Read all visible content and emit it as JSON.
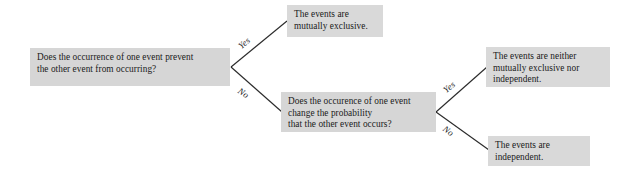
{
  "diagram": {
    "type": "decision-tree",
    "stroke_color": "#2b2b2b",
    "box_fill_color": "#d6d6d6",
    "background_color": "#ffffff",
    "nodes": [
      {
        "id": "root-question",
        "kind": "decision",
        "text": "Does the occurrence of one event prevent\nthe other event from occurring?"
      },
      {
        "id": "mutually-exclusive",
        "kind": "outcome",
        "text": "The events are\nmutually exclusive."
      },
      {
        "id": "second-question",
        "kind": "decision",
        "text": "Does the occurence of one event\nchange the probability\nthat the other event occurs?"
      },
      {
        "id": "neither-outcome",
        "kind": "outcome",
        "text": "The events are neither\nmutually exclusive  nor\nindependent."
      },
      {
        "id": "independent-outcome",
        "kind": "outcome",
        "text": "The events are\nindependent."
      }
    ],
    "edges": [
      {
        "id": "root-yes",
        "from": "root-question",
        "to": "mutually-exclusive",
        "label": "Yes"
      },
      {
        "id": "root-no",
        "from": "root-question",
        "to": "second-question",
        "label": "No"
      },
      {
        "id": "second-yes",
        "from": "second-question",
        "to": "neither-outcome",
        "label": "Yes"
      },
      {
        "id": "second-no",
        "from": "second-question",
        "to": "independent-outcome",
        "label": "No"
      }
    ]
  }
}
